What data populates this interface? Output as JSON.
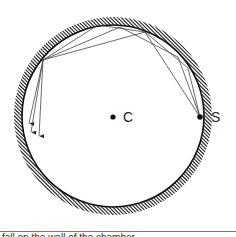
{
  "diagram": {
    "labels": {
      "center": "C",
      "source": "S"
    },
    "circle": {
      "cx": 113,
      "cy": 116,
      "r": 91,
      "hatch_outward": true
    },
    "points": {
      "C": [
        113,
        117
      ],
      "S": [
        200,
        117
      ]
    },
    "rays": [
      {
        "path": [
          [
            200,
            117
          ],
          [
            145,
            32
          ],
          [
            43,
            60
          ],
          [
            29,
            123
          ]
        ]
      },
      {
        "path": [
          [
            200,
            117
          ],
          [
            188,
            68
          ],
          [
            145,
            32
          ],
          [
            98,
            25
          ],
          [
            43,
            60
          ],
          [
            31,
            132
          ]
        ]
      },
      {
        "path": [
          [
            200,
            117
          ],
          [
            178,
            57
          ],
          [
            120,
            27
          ],
          [
            43,
            60
          ],
          [
            39,
            136
          ]
        ]
      }
    ],
    "colors": {
      "line": "#111111",
      "ray": "#444444",
      "hatch": "#222222"
    }
  },
  "caption": "fall on the wall of the chamber..."
}
